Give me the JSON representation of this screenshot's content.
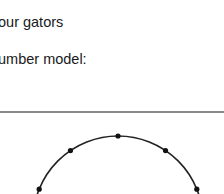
{
  "text": {
    "line1": "our gators",
    "line2": "umber model:"
  },
  "diagram": {
    "type": "circular number model",
    "circle": {
      "cx": 118,
      "cy": 221,
      "r": 85,
      "stroke": "#222222"
    },
    "dots_angles_deg": [
      -90,
      -56,
      -124,
      -22,
      -158
    ],
    "dot_color": "#111111",
    "separator_color": "#8a8a8a"
  }
}
